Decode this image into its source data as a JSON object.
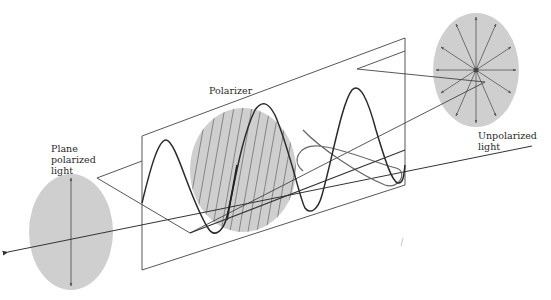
{
  "labels": {
    "polarizer": "Polarizer",
    "plane_polarized": "Plane\npolarized\nlight",
    "unpolarized": "Unpolarized\nlight"
  },
  "colors": {
    "background": "#ffffff",
    "disc_fill": "#cfcfcf",
    "line": "#333333",
    "thin_line": "#555555",
    "wave": "#2a2a2a",
    "ellipse_wave": "#666666"
  },
  "elements": {
    "plane_polarized_disc": "disc with single vertical double-headed arrow",
    "polarizer_disc": "hatched disc with diagonal lines",
    "unpolarized_disc": "disc with 12 radial double-headed arrows",
    "light_axis": "arrow pointing left, direction of propagation",
    "vertical_plane": "parallelogram plane of polarization",
    "horizontal_plane": "parallelogram horizontal plane",
    "vertical_wave": "sinusoid in vertical plane",
    "horizontal_wave": "sinusoid in horizontal plane (right portion only)"
  }
}
